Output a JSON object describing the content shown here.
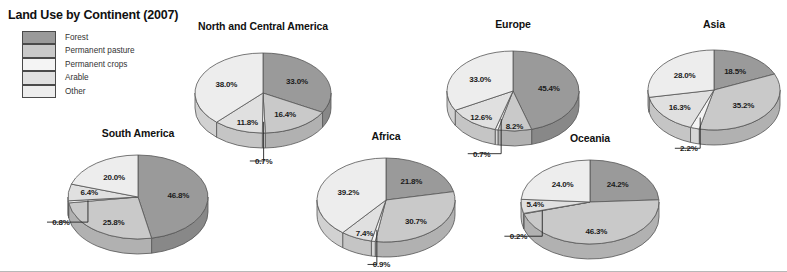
{
  "title": "Land Use by Continent (2007)",
  "legend": {
    "items": [
      {
        "label": "Forest",
        "color": "#9a9a9a"
      },
      {
        "label": "Permanent pasture",
        "color": "#c9c9c9"
      },
      {
        "label": "Permanent crops",
        "color": "#f4f4f4"
      },
      {
        "label": "Arable",
        "color": "#e0e0e0"
      },
      {
        "label": "Other",
        "color": "#ededed"
      }
    ]
  },
  "chart_data": {
    "type": "pie",
    "title": "Land Use by Continent (2007)",
    "legend_position": "top-left",
    "categories": [
      "Forest",
      "Permanent pasture",
      "Permanent crops",
      "Arable",
      "Other"
    ],
    "colors": [
      "#9a9a9a",
      "#c9c9c9",
      "#f4f4f4",
      "#e0e0e0",
      "#ededed"
    ],
    "unit": "%",
    "charts": [
      {
        "name": "north-and-central-america",
        "title": "North and Central America",
        "values": [
          33.0,
          16.4,
          0.7,
          11.8,
          38.0
        ],
        "labels": [
          "33.0%",
          "16.4%",
          "0.7%",
          "11.8%",
          "38.0%"
        ]
      },
      {
        "name": "europe",
        "title": "Europe",
        "values": [
          45.4,
          8.2,
          0.7,
          12.6,
          33.0
        ],
        "labels": [
          "45.4%",
          "8.2%",
          "0.7%",
          "12.6%",
          "33.0%"
        ]
      },
      {
        "name": "asia",
        "title": "Asia",
        "values": [
          18.5,
          35.2,
          2.2,
          16.3,
          28.0
        ],
        "labels": [
          "18.5%",
          "35.2%",
          "2.2%",
          "16.3%",
          "28.0%"
        ]
      },
      {
        "name": "south-america",
        "title": "South America",
        "values": [
          46.8,
          25.8,
          0.8,
          6.4,
          20.0
        ],
        "labels": [
          "46.8%",
          "25.8%",
          "0.8%",
          "6.4%",
          "20.0%"
        ]
      },
      {
        "name": "africa",
        "title": "Africa",
        "values": [
          21.8,
          30.7,
          0.9,
          7.4,
          39.2
        ],
        "labels": [
          "21.8%",
          "30.7%",
          "0.9%",
          "7.4%",
          "39.2%"
        ]
      },
      {
        "name": "oceania",
        "title": "Oceania",
        "values": [
          24.2,
          46.3,
          0.2,
          5.4,
          24.0
        ],
        "labels": [
          "24.2%",
          "46.3%",
          "0.2%",
          "5.4%",
          "24.0%"
        ]
      }
    ]
  },
  "layout": {
    "north-and-central-america": {
      "cx": 263,
      "cy": 93,
      "rx": 68,
      "ry": 40,
      "depth": 15,
      "titleY": 20
    },
    "europe": {
      "cx": 513,
      "cy": 91,
      "rx": 66,
      "ry": 40,
      "depth": 15,
      "titleY": 18
    },
    "asia": {
      "cx": 714,
      "cy": 90,
      "rx": 66,
      "ry": 40,
      "depth": 15,
      "titleY": 18
    },
    "south-america": {
      "cx": 138,
      "cy": 197,
      "rx": 70,
      "ry": 42,
      "depth": 15,
      "titleY": 127
    },
    "africa": {
      "cx": 386,
      "cy": 200,
      "rx": 69,
      "ry": 42,
      "depth": 15,
      "titleY": 130
    },
    "oceania": {
      "cx": 590,
      "cy": 202,
      "rx": 69,
      "ry": 42,
      "depth": 15,
      "titleY": 132
    }
  }
}
